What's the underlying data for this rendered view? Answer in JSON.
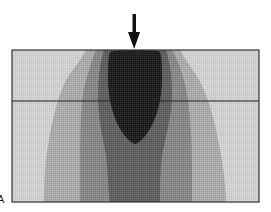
{
  "figure": {
    "panel_label": "A",
    "colors": {
      "background": "#d2d2d2",
      "level1": "#ababab",
      "level2": "#878787",
      "level3": "#5e5e5e",
      "core": "#1c1c1c",
      "outline": "#222222",
      "arrow": "#111111"
    },
    "annotations": {
      "arrow": "downward load arrow at top center",
      "horizontal_line": "interface line across the block"
    }
  }
}
